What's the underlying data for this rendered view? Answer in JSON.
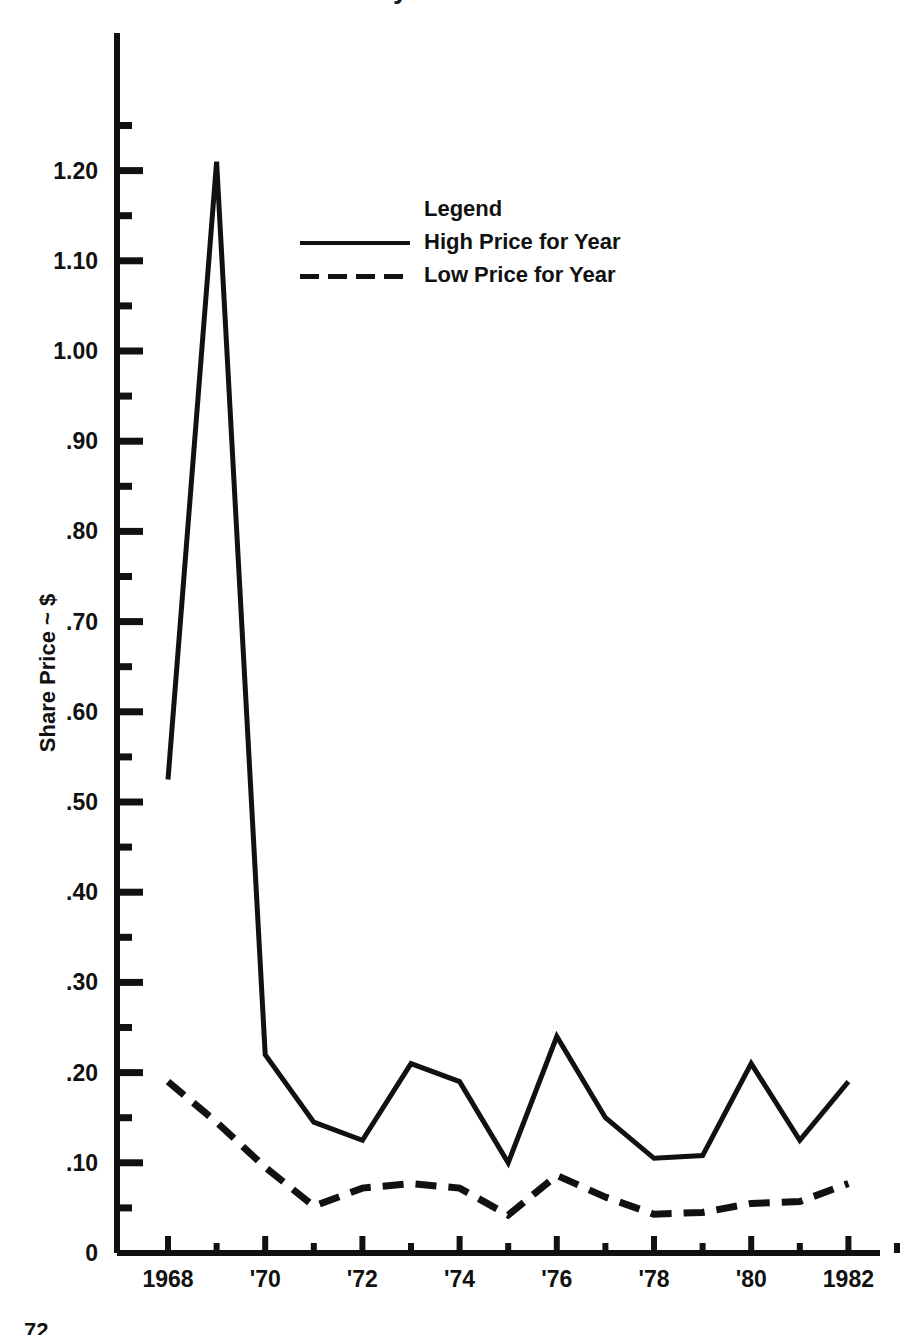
{
  "figure": {
    "title_fragment": "Share Price History",
    "page_number": "72"
  },
  "axes": {
    "ylabel": "Share Price ~ $",
    "xlabel": "",
    "y_zero_label": "0",
    "ytick_labels": [
      "1.20",
      "1.10",
      "1.00",
      ".90",
      ".80",
      ".70",
      ".60",
      ".50",
      ".40",
      ".30",
      ".20",
      ".10"
    ],
    "xtick_labels": [
      "1968",
      "'70",
      "'72",
      "'74",
      "'76",
      "'78",
      "'80",
      "1982"
    ]
  },
  "legend": {
    "title": "Legend",
    "entries": [
      {
        "label": "High Price for Year",
        "style": "solid"
      },
      {
        "label": "Low Price for Year",
        "style": "dashed"
      }
    ]
  },
  "chart_data": {
    "type": "line",
    "title": "Share Price History",
    "xlabel": "",
    "ylabel": "Share Price ~ $",
    "xlim": [
      1967.5,
      1983.5
    ],
    "ylim": [
      0,
      1.27
    ],
    "grid": false,
    "legend_position": "upper-center",
    "x": [
      1968,
      1969,
      1970,
      1971,
      1972,
      1973,
      1974,
      1975,
      1976,
      1977,
      1978,
      1979,
      1980,
      1981,
      1982
    ],
    "categories": [
      "1968",
      "1969",
      "1970",
      "1971",
      "1972",
      "1973",
      "1974",
      "1975",
      "1976",
      "1977",
      "1978",
      "1979",
      "1980",
      "1981",
      "1982"
    ],
    "series": [
      {
        "name": "High Price for Year",
        "style": "solid",
        "values": [
          0.525,
          1.21,
          0.22,
          0.145,
          0.125,
          0.21,
          0.19,
          0.1,
          0.24,
          0.15,
          0.105,
          0.108,
          0.21,
          0.125,
          0.19
        ]
      },
      {
        "name": "Low Price for Year",
        "style": "dashed",
        "values": [
          0.19,
          0.145,
          0.095,
          0.052,
          0.072,
          0.077,
          0.072,
          0.042,
          0.086,
          0.062,
          0.043,
          0.045,
          0.055,
          0.057,
          0.077
        ]
      }
    ],
    "y_major_ticks": [
      0.1,
      0.2,
      0.3,
      0.4,
      0.5,
      0.6,
      0.7,
      0.8,
      0.9,
      1.0,
      1.1,
      1.2
    ],
    "y_minor_ticks": [
      0.05,
      0.15,
      0.25,
      0.35,
      0.45,
      0.55,
      0.65,
      0.75,
      0.85,
      0.95,
      1.05,
      1.15,
      1.25
    ],
    "x_major_ticks": [
      1968,
      1970,
      1972,
      1974,
      1976,
      1978,
      1980,
      1982
    ],
    "x_minor_ticks": [
      1969,
      1971,
      1973,
      1975,
      1977,
      1979,
      1981,
      1983
    ]
  },
  "colors": {
    "ink": "#111111",
    "paper": "#ffffff"
  }
}
